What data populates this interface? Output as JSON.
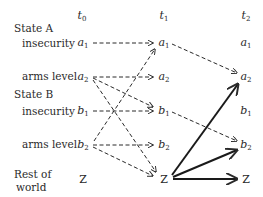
{
  "time_headers": [
    {
      "label": "t",
      "sub": "0",
      "x": 82
    },
    {
      "label": "t",
      "sub": "1",
      "x": 164
    },
    {
      "label": "t",
      "sub": "2",
      "x": 246
    }
  ],
  "row_labels": {
    "state_a": "State A",
    "a_insecurity": "insecurity",
    "a_arms": "arms level",
    "state_b": "State B",
    "b_insecurity": "insecurity",
    "b_arms": "arms level",
    "rest_line1": "Rest of",
    "rest_line2": "world"
  },
  "nodes": {
    "a1": {
      "label": "a",
      "sub": "1",
      "y": 43
    },
    "a2": {
      "label": "a",
      "sub": "2",
      "y": 77
    },
    "b1": {
      "label": "b",
      "sub": "1",
      "y": 111
    },
    "b2": {
      "label": "b",
      "sub": "2",
      "y": 145
    },
    "z": {
      "label": "Z",
      "sub": "",
      "y": 179
    }
  },
  "edges_t0_t1_dashed": [
    "a1→a1",
    "a2→a2",
    "a2→b1",
    "a2→Z",
    "b1→b1",
    "b2→a1",
    "b2→b2",
    "b2→Z"
  ],
  "edges_t1_t2_dashed": [
    "a1→a2",
    "b1→b2"
  ],
  "edges_t1_t2_solid": [
    "Z→a2",
    "Z→b2",
    "Z→Z"
  ]
}
